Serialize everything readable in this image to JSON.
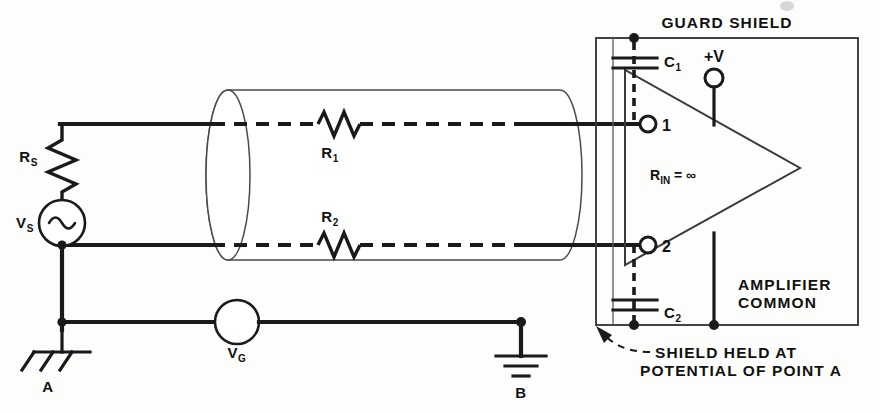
{
  "figure": {
    "kind": "schematic-circuit-diagram",
    "title_visible": false
  },
  "labels": {
    "guard_shield": "GUARD SHIELD",
    "amplifier_common_line1": "AMPLIFIER",
    "amplifier_common_line2": "COMMON",
    "shield_note_line1": "SHIELD HELD AT",
    "shield_note_line2": "POTENTIAL OF POINT A",
    "supply_positive": "+V",
    "terminal_one": "1",
    "terminal_two": "2",
    "ground_point_a": "A",
    "ground_point_b": "B"
  },
  "components": {
    "source_resistor": {
      "symbol": "R",
      "subscript": "S",
      "type": "resistor"
    },
    "source_voltage": {
      "symbol": "V",
      "subscript": "S",
      "type": "ac-source"
    },
    "ground_voltage": {
      "symbol": "V",
      "subscript": "G",
      "type": "source"
    },
    "cable_resistor_1": {
      "symbol": "R",
      "subscript": "1",
      "type": "resistor"
    },
    "cable_resistor_2": {
      "symbol": "R",
      "subscript": "2",
      "type": "resistor"
    },
    "capacitor_1": {
      "symbol": "C",
      "subscript": "1",
      "type": "capacitor"
    },
    "capacitor_2": {
      "symbol": "C",
      "subscript": "2",
      "type": "capacitor"
    },
    "input_resistance": {
      "symbol": "R",
      "subscript": "IN",
      "relation": "=",
      "value": "∞"
    }
  },
  "colors": {
    "ink": "#1a1a1a",
    "light_ink": "#4a4a4a",
    "paper": "#fdfdfc"
  }
}
